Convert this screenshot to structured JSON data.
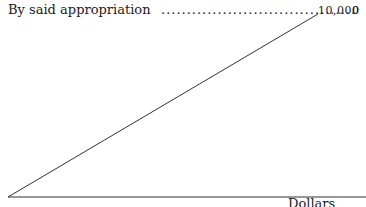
{
  "entry": {
    "label": "By said appropriation",
    "leader": "......................................",
    "amount": "10,000",
    "cents": "0"
  },
  "footer": {
    "label": "Dollars"
  },
  "diagram": {
    "diagonal": {
      "x1": 8,
      "y1": 197,
      "x2": 318,
      "y2": 14
    },
    "baseline": {
      "x1": 8,
      "y1": 197,
      "x2": 366,
      "y2": 197
    },
    "stroke_color": "#333333"
  }
}
